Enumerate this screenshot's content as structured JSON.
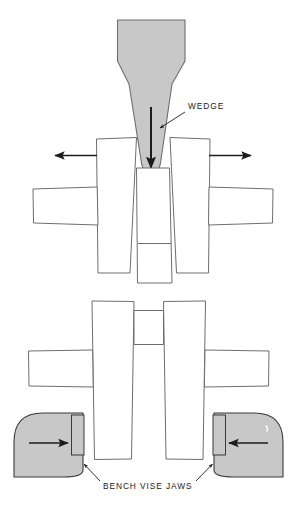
{
  "figure": {
    "background_color": "#ffffff",
    "metal_fill_color": "#c8c8c8",
    "outline_color": "#6e6e6e",
    "dark_outline_color": "#3a3a3a",
    "arrow_color": "#1c1c1c",
    "text_color": "#1c1c1c"
  },
  "labels": {
    "wedge": "WEDGE",
    "bench_vise_jaws": "BENCH VISE JAWS"
  },
  "top_view": {
    "name": "wedge-driving-view",
    "wedge": {
      "name": "wedge",
      "fill": "#c8c8c8",
      "description": "tapered gray wedge with rounded tip"
    },
    "force_arrow": {
      "name": "wedge-force-arrow",
      "direction": "down"
    },
    "spread_arrows": [
      {
        "name": "spread-arrow-left",
        "direction": "left"
      },
      {
        "name": "spread-arrow-right",
        "direction": "right"
      }
    ],
    "workpiece": {
      "name": "split-workpiece",
      "parts": [
        "left-half",
        "right-half",
        "center-column",
        "left-side-bar",
        "right-side-bar"
      ]
    }
  },
  "bottom_view": {
    "name": "vise-clamping-view",
    "workpiece": {
      "name": "clamped-workpiece",
      "parts": [
        "left-half",
        "right-half",
        "center-slot",
        "left-side-bar",
        "right-side-bar"
      ]
    },
    "vise_jaws": [
      {
        "name": "bench-vise-jaw-left",
        "fill": "#c8c8c8",
        "arrow_direction": "right"
      },
      {
        "name": "bench-vise-jaw-right",
        "fill": "#c8c8c8",
        "arrow_direction": "left"
      }
    ],
    "clamp_arrows": [
      {
        "name": "clamp-arrow-left",
        "direction": "right"
      },
      {
        "name": "clamp-arrow-right",
        "direction": "left"
      }
    ]
  }
}
